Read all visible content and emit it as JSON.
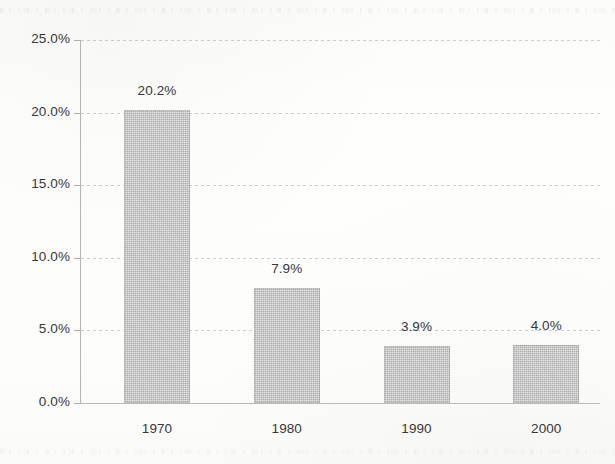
{
  "chart_data": {
    "type": "bar",
    "title": "",
    "subtitle": "",
    "xlabel": "",
    "ylabel": "",
    "categories": [
      "1970",
      "1980",
      "1990",
      "2000"
    ],
    "values": [
      20.2,
      7.9,
      3.9,
      4.0
    ],
    "data_labels": [
      "20.2%",
      "7.9%",
      "3.9%",
      "4.0%"
    ],
    "ylim": [
      0,
      25
    ],
    "ytick_values": [
      25.0,
      20.0,
      15.0,
      10.0,
      5.0,
      0.0
    ],
    "ytick_labels": [
      "25.0%",
      "20.0%",
      "15.0%",
      "10.0%",
      "5.0%",
      "0.0%"
    ],
    "grid": true,
    "grid_axis": "y",
    "legend": false,
    "legend_position": "none",
    "bar_color": "#c3c3c3",
    "axis_color": "#b4b4b4",
    "grid_color": "#969696",
    "text_color": "#37373a",
    "background_color": "#fdfdfc"
  }
}
